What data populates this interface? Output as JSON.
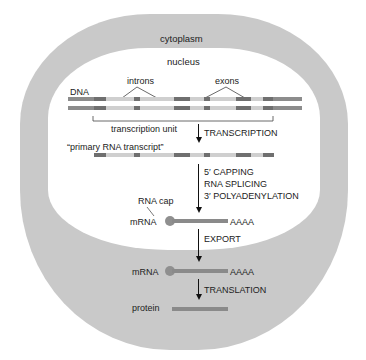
{
  "diagram": {
    "compartments": {
      "outer": "cytoplasm",
      "inner": "nucleus"
    },
    "labels": {
      "dna": "DNA",
      "introns": "introns",
      "exons": "exons",
      "transcription_unit": "transcription unit",
      "primary_transcript": "“primary RNA transcript”",
      "rna_cap": "RNA cap",
      "mrna_nucleus": "mRNA",
      "polyA_nucleus": "AAAA",
      "mrna_cytoplasm": "mRNA",
      "polyA_cytoplasm": "AAAA",
      "protein": "protein"
    },
    "steps": {
      "transcription": "TRANSCRIPTION",
      "processing": [
        "5′ CAPPING",
        "RNA SPLICING",
        "3′ POLYADENYLATION"
      ],
      "export": "EXPORT",
      "translation": "TRANSLATION"
    },
    "colors": {
      "cytoplasm": "#c9c9c9",
      "nucleus": "#ffffff",
      "flank": "#8c8c8c",
      "exon": "#6f6f6f",
      "intron": "#cfcfcf",
      "mrna": "#8a8a8a"
    }
  }
}
